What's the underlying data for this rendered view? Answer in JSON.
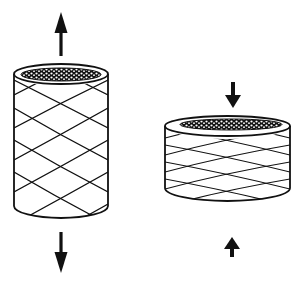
{
  "diagram": {
    "description": "Braided tubular sleeve under axial tension elongates and narrows; under axial compression it shortens and widens",
    "stroke_color": "#111111",
    "background": "#ffffff",
    "panels": [
      {
        "id": "extended",
        "state_label": "Tension (elongated, narrow)",
        "arrows": [
          "up",
          "down"
        ],
        "arrow_direction": "outward"
      },
      {
        "id": "compressed",
        "state_label": "Compression (shortened, wide)",
        "arrows": [
          "down",
          "up"
        ],
        "arrow_direction": "inward"
      }
    ]
  }
}
